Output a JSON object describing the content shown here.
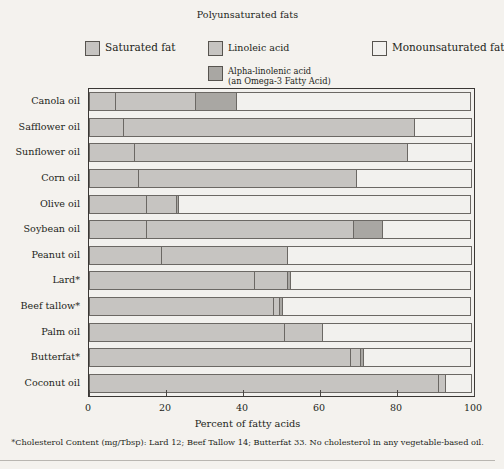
{
  "legend": {
    "group_title": "Polyunsaturated fats",
    "items": [
      {
        "key": "saturated",
        "label": "Saturated fat",
        "color": "#c6c4c1",
        "swatch": "sw-sat"
      },
      {
        "key": "linoleic",
        "label": "Linoleic acid",
        "color": "#c6c4c1",
        "swatch": "sw-lin"
      },
      {
        "key": "monounsaturated",
        "label": "Monounsaturated fat",
        "color": "#f2f1ee",
        "swatch": "sw-mono"
      },
      {
        "key": "alpha_linolenic",
        "label": "Alpha-linolenic acid\n(an Omega-3 Fatty Acid)",
        "color": "#a9a7a3",
        "swatch": "sw-ala"
      }
    ],
    "ala_line1": "Alpha-linolenic acid",
    "ala_line2": "(an Omega-3 Fatty Acid)"
  },
  "axis": {
    "xlabel": "Percent of fatty acids",
    "xticks": [
      "0",
      "20",
      "40",
      "60",
      "80",
      "100"
    ],
    "xtick_values": [
      0,
      20,
      40,
      60,
      80,
      100
    ],
    "xlim": [
      0,
      100
    ]
  },
  "footnote": "*Cholesterol Content (mg/Tbsp): Lard 12; Beef Tallow 14; Butterfat 33. No cholesterol in any vegetable-based oil.",
  "chart_data": {
    "type": "bar",
    "orientation": "horizontal",
    "stacked": true,
    "title": "",
    "xlabel": "Percent of fatty acids",
    "ylabel": "",
    "xlim": [
      0,
      100
    ],
    "grid": false,
    "legend_position": "top",
    "categories": [
      "Canola oil",
      "Safflower oil",
      "Sunflower oil",
      "Corn oil",
      "Olive oil",
      "Soybean oil",
      "Peanut oil",
      "Lard*",
      "Beef tallow*",
      "Palm oil",
      "Butterfat*",
      "Coconut oil"
    ],
    "series": [
      {
        "name": "Saturated fat",
        "key": "saturated",
        "color": "#c6c4c1",
        "values": [
          7,
          9,
          12,
          13,
          15,
          15,
          19,
          43,
          48,
          51,
          68,
          91
        ]
      },
      {
        "name": "Linoleic acid",
        "key": "linoleic",
        "color": "#c6c4c1",
        "values": [
          21,
          76,
          71,
          57,
          8,
          54,
          33,
          9,
          2,
          10,
          3,
          2
        ]
      },
      {
        "name": "Alpha-linolenic acid",
        "key": "alpha_linolenic",
        "color": "#a9a7a3",
        "values": [
          11,
          0,
          0,
          0,
          1,
          8,
          0,
          1,
          1,
          0,
          1,
          0
        ]
      },
      {
        "name": "Monounsaturated fat",
        "key": "monounsaturated",
        "color": "#f2f1ee",
        "values": [
          61,
          15,
          17,
          30,
          76,
          23,
          48,
          47,
          49,
          39,
          28,
          7
        ]
      }
    ]
  }
}
